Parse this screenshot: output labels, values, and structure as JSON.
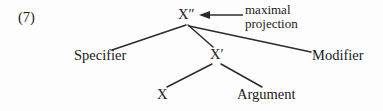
{
  "figure": {
    "example_number": "(7)",
    "type": "x-bar-syntax-tree"
  },
  "nodes": {
    "maximal_projection": "X″",
    "intermediate_projection": "X′",
    "head": "X",
    "specifier": "Specifier",
    "modifier": "Modifier",
    "argument": "Argument"
  },
  "annotation": {
    "line1": "maximal",
    "line2": "projection",
    "arrow": "leftwards-arrow"
  },
  "colors": {
    "background": "#fdfdfd",
    "ink": "#1a1a1a",
    "line": "#2b2b2b"
  }
}
